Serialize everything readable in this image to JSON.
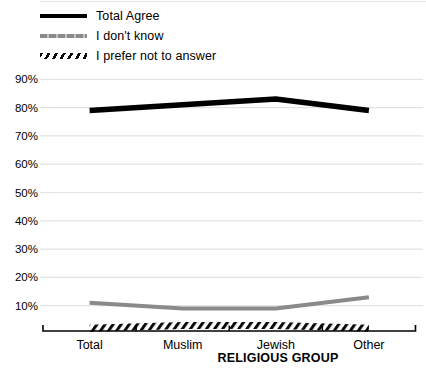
{
  "figure": {
    "background": "#ffffff",
    "top_border_color": "#e7e7e7"
  },
  "legend": {
    "position": "top-left",
    "items": [
      {
        "label": "Total Agree",
        "swatch": "solid-black"
      },
      {
        "label": "I don't know",
        "swatch": "dashed-gray"
      },
      {
        "label": "I prefer not to answer",
        "swatch": "hatched"
      }
    ]
  },
  "chart_data": {
    "type": "line",
    "categories": [
      "Total",
      "Muslim",
      "Jewish",
      "Other"
    ],
    "series": [
      {
        "name": "Total Agree",
        "values": [
          79,
          81,
          83,
          79
        ],
        "color": "#000000",
        "style": "solid",
        "width": 5.5
      },
      {
        "name": "I don't know",
        "values": [
          11,
          9,
          9,
          13
        ],
        "color": "#8a8a8a",
        "style": "solid",
        "width": 4
      },
      {
        "name": "I prefer not to answer",
        "values": [
          2,
          3,
          3,
          2
        ],
        "color": "#0a0a0a",
        "style": "hatched",
        "width": 7
      }
    ],
    "title": "",
    "xlabel": "RELIGIOUS GROUP",
    "ylabel": "",
    "ylim": [
      0,
      95
    ],
    "yticks": [
      90,
      80,
      70,
      60,
      50,
      40,
      30,
      20,
      10
    ],
    "ytick_suffix": "%",
    "grid": true,
    "gridline_color": "#e3e3e3",
    "axis_color": "#000000",
    "tick_label_color": "#000000"
  }
}
